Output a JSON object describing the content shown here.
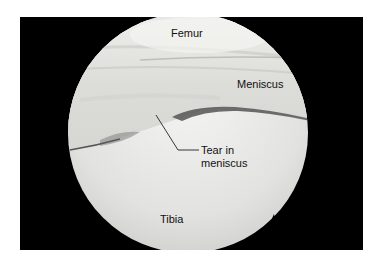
{
  "figure": {
    "type": "arthroscopic view of knee joint",
    "labels": {
      "femur": "Femur",
      "meniscus": "Meniscus",
      "tear_line1": "Tear in",
      "tear_line2": "meniscus",
      "tibia": "Tibia"
    }
  }
}
